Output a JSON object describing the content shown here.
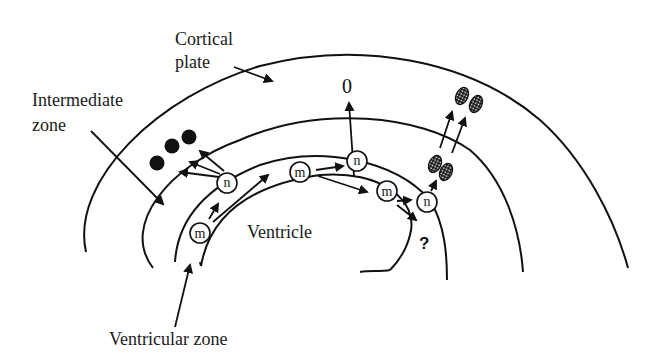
{
  "labels": {
    "cortical_plate_line1": "Cortical",
    "cortical_plate_line2": "plate",
    "intermediate_zone_line1": "Intermediate",
    "intermediate_zone_line2": "zone",
    "ventricle": "Ventricle",
    "ventricular_zone": "Ventricular zone"
  },
  "cells": {
    "m_label": "m",
    "n_label": "n",
    "unknown_fate": "?",
    "zero_symbol": "0"
  },
  "legend_semantics": {
    "m": "mitotic / progenitor cell",
    "n": "newly generated cell",
    "filled_dots": "cells in intermediate zone",
    "hatched_ovals": "migrating paired cells"
  },
  "colors": {
    "stroke": "#111111",
    "background": "#ffffff"
  }
}
